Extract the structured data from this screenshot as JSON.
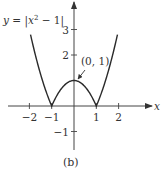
{
  "chart_data": {
    "type": "line",
    "title": "",
    "function_label": "y = |x² − 1|",
    "function_label_parts": {
      "y": "y",
      "eq": " = |",
      "x": "x",
      "sup": "2",
      "rest": " − 1|"
    },
    "xlabel": "x",
    "ylabel": "",
    "caption": "(b)",
    "xlim": [
      -2.4,
      2.3
    ],
    "ylim": [
      -1.5,
      3.5
    ],
    "x_ticks": [
      {
        "value": -2,
        "label": "−2"
      },
      {
        "value": -1,
        "label": "−1"
      },
      {
        "value": 1,
        "label": "1"
      },
      {
        "value": 2,
        "label": "2"
      }
    ],
    "y_ticks": [
      {
        "value": 3,
        "label": "3"
      },
      {
        "value": 2,
        "label": "2"
      },
      {
        "value": -1,
        "label": "−1"
      }
    ],
    "annotation": {
      "text": "(0, 1)",
      "x": 0,
      "y": 1
    },
    "series": [
      {
        "name": "y = |x^2 - 1|",
        "x": [
          -1.95,
          -1.75,
          -1.5,
          -1.25,
          -1.0,
          -0.75,
          -0.5,
          -0.25,
          0,
          0.25,
          0.5,
          0.75,
          1.0,
          1.25,
          1.5,
          1.75,
          1.95
        ],
        "values": [
          2.8,
          2.06,
          1.25,
          0.56,
          0,
          0.44,
          0.75,
          0.94,
          1,
          0.94,
          0.75,
          0.44,
          0,
          0.56,
          1.25,
          2.06,
          2.8
        ]
      }
    ],
    "grid": false,
    "legend": "none"
  },
  "colors": {
    "curve": "#2b2b2b",
    "axis": "#444444",
    "text": "#333333"
  }
}
